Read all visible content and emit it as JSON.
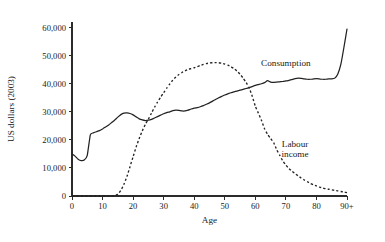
{
  "chart_data": {
    "type": "line",
    "title": "",
    "xlabel": "Age",
    "ylabel": "US dollars (2003)",
    "xlim": [
      0,
      90
    ],
    "ylim": [
      0,
      62000
    ],
    "grid": false,
    "legend_position": "inline-annotation",
    "x_tick_labels": [
      "0",
      "10",
      "20",
      "30",
      "40",
      "50",
      "60",
      "70",
      "80",
      "90+"
    ],
    "x_tick_values": [
      0,
      10,
      20,
      30,
      40,
      50,
      60,
      70,
      80,
      90
    ],
    "y_tick_labels": [
      "0",
      "10,000",
      "20,000",
      "30,000",
      "40,000",
      "50,000",
      "60,000"
    ],
    "y_tick_values": [
      0,
      10000,
      20000,
      30000,
      40000,
      50000,
      60000
    ],
    "x": [
      0,
      1,
      2,
      3,
      4,
      5,
      6,
      7,
      8,
      9,
      10,
      11,
      12,
      13,
      14,
      15,
      16,
      17,
      18,
      19,
      20,
      21,
      22,
      23,
      24,
      25,
      26,
      27,
      28,
      29,
      30,
      31,
      32,
      33,
      34,
      35,
      36,
      37,
      38,
      39,
      40,
      41,
      42,
      43,
      44,
      45,
      46,
      47,
      48,
      49,
      50,
      51,
      52,
      53,
      54,
      55,
      56,
      57,
      58,
      59,
      60,
      61,
      62,
      63,
      64,
      65,
      66,
      67,
      68,
      69,
      70,
      71,
      72,
      73,
      74,
      75,
      76,
      77,
      78,
      79,
      80,
      81,
      82,
      83,
      84,
      85,
      86,
      87,
      88,
      89,
      90
    ],
    "series": [
      {
        "name": "Consumption",
        "style": "solid",
        "color": "#222222",
        "label_x": 70,
        "label_y": 46500,
        "values": [
          15000,
          14200,
          13100,
          12600,
          12800,
          14500,
          21800,
          22500,
          22900,
          23300,
          23900,
          24600,
          25300,
          26200,
          27100,
          28100,
          29000,
          29500,
          29600,
          29400,
          28900,
          28200,
          27500,
          27100,
          26900,
          27000,
          27300,
          27800,
          28300,
          28800,
          29300,
          29700,
          30000,
          30400,
          30600,
          30500,
          30300,
          30300,
          30600,
          31000,
          31300,
          31500,
          31800,
          32200,
          32700,
          33200,
          33800,
          34400,
          35000,
          35500,
          36000,
          36400,
          36800,
          37100,
          37400,
          37700,
          38000,
          38300,
          38600,
          39000,
          39400,
          39700,
          40000,
          40400,
          41100,
          40600,
          40500,
          40600,
          40700,
          40800,
          41000,
          41200,
          41500,
          41800,
          42000,
          41900,
          41700,
          41600,
          41600,
          41700,
          41800,
          41700,
          41600,
          41600,
          41700,
          41700,
          42000,
          43500,
          47000,
          53000,
          59500
        ]
      },
      {
        "name": "Labour income",
        "style": "dashed",
        "color": "#222222",
        "label_x": 73,
        "label_y": 17500,
        "values": [
          0,
          0,
          0,
          0,
          0,
          0,
          0,
          0,
          0,
          0,
          0,
          0,
          0,
          0,
          200,
          600,
          2000,
          4200,
          7000,
          10500,
          14000,
          17500,
          20500,
          23200,
          25500,
          27400,
          29500,
          31600,
          33500,
          35200,
          36800,
          38400,
          39900,
          41300,
          42400,
          43300,
          44000,
          44600,
          45100,
          45400,
          45700,
          46100,
          46500,
          46900,
          47200,
          47400,
          47500,
          47550,
          47500,
          47300,
          47000,
          46600,
          46100,
          45400,
          44500,
          43400,
          42000,
          40400,
          38500,
          35500,
          32000,
          29500,
          27000,
          24000,
          22000,
          20500,
          19000,
          16500,
          14500,
          12500,
          11000,
          9800,
          8800,
          8000,
          7200,
          6400,
          5700,
          5100,
          4500,
          4000,
          3600,
          3200,
          2900,
          2600,
          2400,
          2200,
          2000,
          1800,
          1600,
          1400,
          1200
        ]
      }
    ]
  },
  "axes": {
    "y_title": "US dollars (2003)",
    "x_title": "Age"
  },
  "annotations": {
    "consumption_label": "Consumption",
    "labour_label_line1": "Labour",
    "labour_label_line2": "income"
  }
}
